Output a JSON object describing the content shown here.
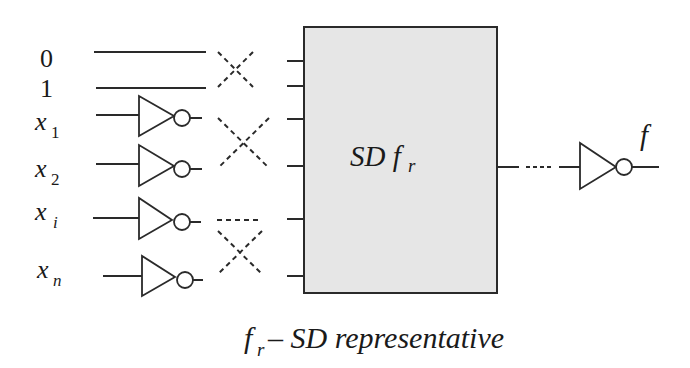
{
  "diagram": {
    "type": "circuit-schematic",
    "inputs": [
      {
        "name": "0",
        "sub": "",
        "inverter": false
      },
      {
        "name": "1",
        "sub": "",
        "inverter": false
      },
      {
        "name": "x",
        "sub": "1",
        "inverter": true
      },
      {
        "name": "x",
        "sub": "2",
        "inverter": true
      },
      {
        "name": "x",
        "sub": "i",
        "inverter": true
      },
      {
        "name": "x",
        "sub": "n",
        "inverter": true
      }
    ],
    "block": {
      "label_main": "SD f",
      "label_sub": "r",
      "fill": "#e6e6e6"
    },
    "output": {
      "label": "f",
      "inverter": true
    },
    "caption": {
      "lead": "f",
      "lead_sub": "r",
      "rest": "– SD representative"
    }
  }
}
